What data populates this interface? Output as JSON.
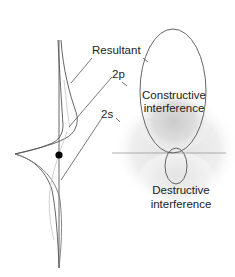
{
  "figure": {
    "wavefunction_labels": {
      "resultant": "Resultant",
      "p_orbital": "2p",
      "s_orbital": "2s"
    },
    "lobe_labels": {
      "constructive_line1": "Constructive",
      "constructive_line2": "interference",
      "destructive_line1": "Destructive",
      "destructive_line2": "interference"
    },
    "colors": {
      "line": "#555555",
      "nucleus": "#000000",
      "shade_light": "#ececec",
      "shade_mid": "#dcdcdc",
      "shade_dark": "#cfcfcf",
      "text": "#222222"
    }
  }
}
